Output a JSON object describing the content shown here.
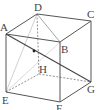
{
  "figure": {
    "type": "cube",
    "labels": {
      "A": "A",
      "B": "B",
      "C": "C",
      "D": "D",
      "E": "E",
      "F": "F",
      "G": "G",
      "H": "H"
    },
    "vertices": {
      "A": [
        6,
        34
      ],
      "B": [
        60,
        42
      ],
      "C": [
        91,
        21
      ],
      "D": [
        37,
        14
      ],
      "E": [
        6,
        92
      ],
      "F": [
        60,
        102
      ],
      "G": [
        91,
        82
      ],
      "H": [
        39,
        74
      ]
    },
    "visible_edges": [
      "AB",
      "BC",
      "CD",
      "DA",
      "AE",
      "BF",
      "CG",
      "EF",
      "FG"
    ],
    "hidden_edges_dashed": [
      "DH",
      "EH",
      "HG"
    ],
    "diagonals": [
      "AG",
      "DB",
      "DE",
      "EB"
    ],
    "point_on_AG": [
      34,
      51
    ],
    "colors": {
      "edge": "#555555",
      "hidden": "#777777",
      "diagonal_light": "#bbbbbb",
      "diagonal_dark": "#444444"
    }
  }
}
